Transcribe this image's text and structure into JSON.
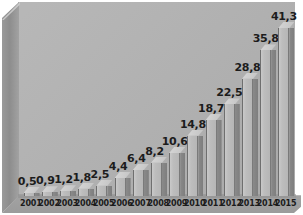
{
  "chart_data": {
    "type": "bar",
    "title": "",
    "subtitle": "",
    "xlabel": "",
    "ylabel": "",
    "grid": false,
    "legend": "none",
    "decimal_separator": ",",
    "style": "3d-bar",
    "ylim": [
      0,
      41.3
    ],
    "categories": [
      "2001",
      "2002",
      "2003",
      "2004",
      "2005",
      "2006",
      "2007",
      "2008",
      "2009",
      "2010",
      "2011",
      "2012",
      "2013",
      "2014",
      "2015"
    ],
    "values": [
      0.5,
      0.9,
      1.2,
      1.8,
      2.5,
      4.4,
      6.4,
      8.2,
      10.6,
      14.8,
      18.7,
      22.5,
      28.8,
      35.8,
      41.3
    ],
    "value_labels": [
      "0,5",
      "0,9",
      "1,2",
      "1,8",
      "2,5",
      "4,4",
      "6,4",
      "8,2",
      "10,6",
      "14,8",
      "18,7",
      "22,5",
      "28,8",
      "35,8",
      "41,3"
    ],
    "series": [
      {
        "name": "",
        "values": [
          0.5,
          0.9,
          1.2,
          1.8,
          2.5,
          4.4,
          6.4,
          8.2,
          10.6,
          14.8,
          18.7,
          22.5,
          28.8,
          35.8,
          41.3
        ]
      }
    ]
  },
  "colors": {
    "background": "#ffffff",
    "back_wall": "#b3b3b3",
    "left_wall": "#8d8d8d",
    "floor": "#9f9f9f",
    "bar_front": "#bdbdbd",
    "bar_side": "#838383",
    "bar_top": "#cdcdcd",
    "bar_outline": "#6f6f6f",
    "label_text": "#1c1c1c"
  }
}
